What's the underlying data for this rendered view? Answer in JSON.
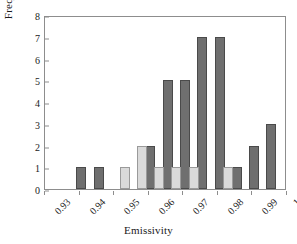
{
  "chart_data": {
    "type": "bar",
    "title": "",
    "xlabel": "Emissivity",
    "ylabel": "Frequency",
    "xlim": [
      0.93,
      1.0
    ],
    "ylim": [
      0,
      8
    ],
    "ytick_labels": [
      "0",
      "1",
      "2",
      "3",
      "4",
      "5",
      "6",
      "7",
      "8"
    ],
    "ytick_values": [
      0,
      1,
      2,
      3,
      4,
      5,
      6,
      7,
      8
    ],
    "xtick_labels": [
      "0.93",
      "0.94",
      "0.95",
      "0.96",
      "0.97",
      "0.98",
      "0.99",
      "1"
    ],
    "xtick_values": [
      0.93,
      0.94,
      0.95,
      0.96,
      0.97,
      0.98,
      0.99,
      1.0
    ],
    "grid": false,
    "legend": "none",
    "series": [
      {
        "name": "dark",
        "color": "#6f6f6f",
        "bars": [
          {
            "x": 0.9405,
            "value": 1
          },
          {
            "x": 0.9455,
            "value": 1
          },
          {
            "x": 0.9605,
            "value": 2
          },
          {
            "x": 0.9655,
            "value": 5
          },
          {
            "x": 0.9705,
            "value": 5
          },
          {
            "x": 0.9755,
            "value": 7
          },
          {
            "x": 0.9805,
            "value": 7
          },
          {
            "x": 0.9855,
            "value": 1
          },
          {
            "x": 0.9905,
            "value": 2
          },
          {
            "x": 0.9955,
            "value": 3
          }
        ]
      },
      {
        "name": "light",
        "color": "#dadada",
        "bars": [
          {
            "x": 0.953,
            "value": 1
          },
          {
            "x": 0.958,
            "value": 2
          },
          {
            "x": 0.963,
            "value": 1
          },
          {
            "x": 0.968,
            "value": 1
          },
          {
            "x": 0.973,
            "value": 1
          },
          {
            "x": 0.983,
            "value": 1
          }
        ]
      }
    ]
  }
}
